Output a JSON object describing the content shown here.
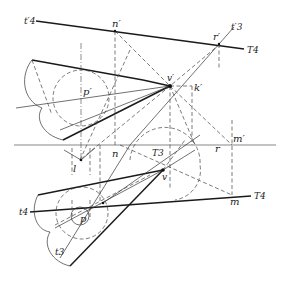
{
  "labels": {
    "t4_prime": "t′4",
    "n_prime": "n′",
    "r_prime": "r′",
    "t3_prime": "t′3",
    "T4_upper": "T4",
    "v_prime": "v′",
    "k_prime": "k′",
    "p_prime": "p′",
    "m_prime": "m′",
    "l": "l",
    "n": "n",
    "T3": "T3",
    "r": "r",
    "v": "v",
    "t4": "t4",
    "p": "p",
    "m": "m",
    "T4_lower": "T4",
    "t3": "t3"
  },
  "colors": {
    "line": "#1a1a1a",
    "construction": "#444444",
    "background": "#ffffff"
  }
}
